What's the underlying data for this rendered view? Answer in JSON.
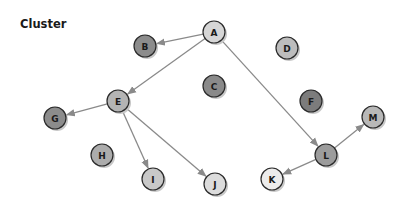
{
  "title": "Cluster",
  "colors": {
    "edge": "#8a8a8a",
    "node_stroke": "#2a2a2a",
    "shadow": "#c8c8c8"
  },
  "nodes": [
    {
      "id": "A",
      "label": "A",
      "x": 214,
      "y": 32,
      "fill": "#d6d6d6"
    },
    {
      "id": "B",
      "label": "B",
      "x": 145,
      "y": 46,
      "fill": "#8c8c8c"
    },
    {
      "id": "C",
      "label": "C",
      "x": 214,
      "y": 86,
      "fill": "#8a8a8a"
    },
    {
      "id": "D",
      "label": "D",
      "x": 287,
      "y": 48,
      "fill": "#bdbdbd"
    },
    {
      "id": "E",
      "label": "E",
      "x": 118,
      "y": 101,
      "fill": "#b4b4b4"
    },
    {
      "id": "F",
      "label": "F",
      "x": 311,
      "y": 101,
      "fill": "#7c7c7c"
    },
    {
      "id": "G",
      "label": "G",
      "x": 55,
      "y": 118,
      "fill": "#8c8c8c"
    },
    {
      "id": "H",
      "label": "H",
      "x": 102,
      "y": 155,
      "fill": "#acacac"
    },
    {
      "id": "I",
      "label": "I",
      "x": 153,
      "y": 179,
      "fill": "#c8c8c8"
    },
    {
      "id": "J",
      "label": "J",
      "x": 215,
      "y": 184,
      "fill": "#dcdcdc"
    },
    {
      "id": "K",
      "label": "K",
      "x": 272,
      "y": 179,
      "fill": "#ececec"
    },
    {
      "id": "L",
      "label": "L",
      "x": 326,
      "y": 155,
      "fill": "#9c9c9c"
    },
    {
      "id": "M",
      "label": "M",
      "x": 373,
      "y": 117,
      "fill": "#b8b8b8"
    }
  ],
  "edges": [
    {
      "from": "A",
      "to": "B"
    },
    {
      "from": "A",
      "to": "E"
    },
    {
      "from": "A",
      "to": "L"
    },
    {
      "from": "E",
      "to": "G"
    },
    {
      "from": "E",
      "to": "I"
    },
    {
      "from": "E",
      "to": "J"
    },
    {
      "from": "L",
      "to": "K"
    },
    {
      "from": "L",
      "to": "M"
    }
  ],
  "node_radius": 11
}
